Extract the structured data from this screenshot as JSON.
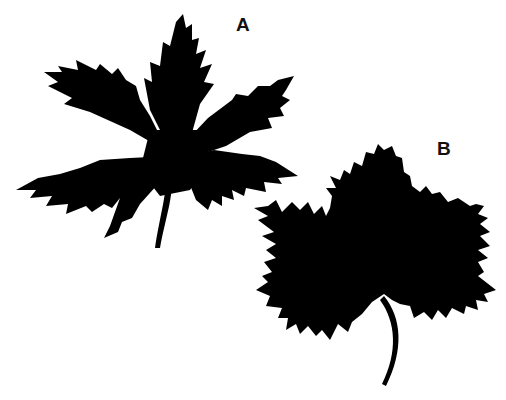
{
  "figure": {
    "background_color": "#ffffff",
    "silhouette_color": "#000000",
    "leaves": [
      {
        "label": "A",
        "description": "deeply palmately lobed leaf with five narrow, sharply toothed lobes and a long curved petiole"
      },
      {
        "label": "B",
        "description": "broad, shallowly lobed leaf with coarsely serrated margins and a curved petiole"
      }
    ]
  }
}
